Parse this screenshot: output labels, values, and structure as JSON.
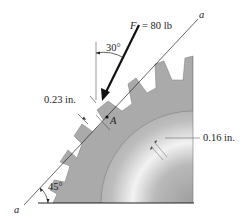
{
  "figure": {
    "title": "",
    "force_label": "F = 80 lb",
    "force_symbol": "F",
    "force_value": "= 80 lb",
    "angle_force": "30°",
    "angle_axis": "45°",
    "axis_label_top": "a",
    "axis_label_bottom": "a",
    "point_label": "A",
    "tooth_thickness": "0.23 in.",
    "rim_thickness": "0.16 in."
  },
  "colors": {
    "gear_fill": "#a9a9a9",
    "gear_light": "#c8c8c8",
    "hub_light": "#f4f4f4",
    "hub_dark": "#9a9a9a",
    "line": "#222222"
  }
}
